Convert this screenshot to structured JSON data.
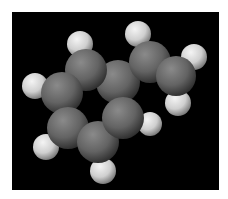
{
  "image": {
    "subject": "space-filling molecular model",
    "background_color": "#000000",
    "border_color": "#ffffff",
    "carbon_color": "#6e6e6e",
    "hydrogen_color": "#e6e6e6"
  },
  "atoms": [
    {
      "element": "C",
      "x": 118,
      "y": 82,
      "r": 22
    },
    {
      "element": "C",
      "x": 150,
      "y": 62,
      "r": 21
    },
    {
      "element": "C",
      "x": 176,
      "y": 76,
      "r": 20
    },
    {
      "element": "C",
      "x": 86,
      "y": 70,
      "r": 21
    },
    {
      "element": "C",
      "x": 62,
      "y": 93,
      "r": 21
    },
    {
      "element": "C",
      "x": 68,
      "y": 128,
      "r": 21
    },
    {
      "element": "C",
      "x": 98,
      "y": 142,
      "r": 21
    },
    {
      "element": "C",
      "x": 123,
      "y": 118,
      "r": 21
    },
    {
      "element": "H",
      "x": 80,
      "y": 44,
      "r": 13
    },
    {
      "element": "H",
      "x": 138,
      "y": 34,
      "r": 13
    },
    {
      "element": "H",
      "x": 194,
      "y": 57,
      "r": 13
    },
    {
      "element": "H",
      "x": 178,
      "y": 103,
      "r": 13
    },
    {
      "element": "H",
      "x": 35,
      "y": 86,
      "r": 13
    },
    {
      "element": "H",
      "x": 46,
      "y": 147,
      "r": 13
    },
    {
      "element": "H",
      "x": 103,
      "y": 171,
      "r": 13
    },
    {
      "element": "H",
      "x": 150,
      "y": 124,
      "r": 12
    }
  ]
}
